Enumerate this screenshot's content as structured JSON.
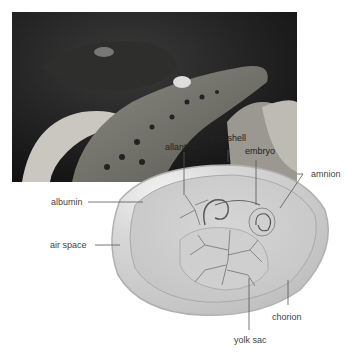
{
  "figure": {
    "photo_subject": "baby crocodile hatching from egg",
    "diagram_subject": "amniotic egg cross-section"
  },
  "labels": {
    "allantois": "allantois",
    "egg_shell": "egg shell",
    "embryo": "embryo",
    "amnion": "amnion",
    "albumin": "albumin",
    "air_space": "air space",
    "chorion": "chorion",
    "yolk_sac": "yolk sac"
  },
  "colors": {
    "label_text": "#444444",
    "leader_line": "#555555",
    "egg_fill": "#d9d9d9",
    "photo_bg": "#1a1a1a"
  }
}
